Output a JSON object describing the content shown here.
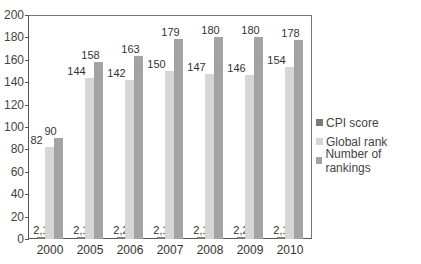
{
  "chart_data": {
    "type": "bar",
    "title": "",
    "xlabel": "",
    "ylabel": "",
    "ylim": [
      0,
      200
    ],
    "yticks": [
      0,
      20,
      40,
      60,
      80,
      100,
      120,
      140,
      160,
      180,
      200
    ],
    "categories": [
      "2000",
      "2005",
      "2006",
      "2007",
      "2008",
      "2009",
      "2010"
    ],
    "series": [
      {
        "name": "CPI score",
        "color": "#7a7a7a",
        "values": [
          2.1,
          2.1,
          2.2,
          2.1,
          2.1,
          2.2,
          2.1
        ],
        "labels": [
          "2,1",
          "2,1",
          "2,2",
          "2,1",
          "2,1",
          "2,2",
          "2,1"
        ]
      },
      {
        "name": "Global rank",
        "color": "#d6d6d6",
        "values": [
          82,
          144,
          142,
          150,
          147,
          146,
          154
        ],
        "labels": [
          "82",
          "144",
          "142",
          "150",
          "147",
          "146",
          "154"
        ]
      },
      {
        "name": "Number of rankings",
        "color": "#a3a3a3",
        "values": [
          90,
          158,
          163,
          179,
          180,
          180,
          178
        ],
        "labels": [
          "90",
          "158",
          "163",
          "179",
          "180",
          "180",
          "178"
        ]
      }
    ],
    "legend_position": "right",
    "grid": false
  },
  "legend": {
    "items": [
      {
        "label": "CPI score"
      },
      {
        "label": "Global rank"
      },
      {
        "label": "Number of rankings"
      }
    ]
  }
}
